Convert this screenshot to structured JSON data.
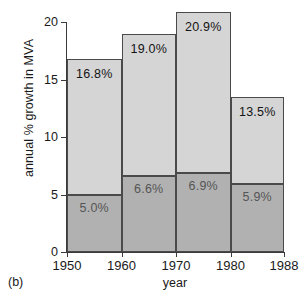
{
  "caption": "(b)",
  "chart_data": {
    "type": "bar",
    "subtype": "stacked",
    "title": "",
    "xlabel": "year",
    "ylabel": "annual % growth in MVA",
    "categories": [
      "1950",
      "1960",
      "1970",
      "1980"
    ],
    "x_tick_labels": [
      "1950",
      "1960",
      "1970",
      "1980",
      "1988"
    ],
    "y_tick_labels": [
      "0",
      "5",
      "10",
      "15",
      "20"
    ],
    "y_ticks": [
      0,
      5,
      10,
      15,
      20
    ],
    "ylim": [
      0,
      21.5
    ],
    "grid": false,
    "legend": "none",
    "series": [
      {
        "name": "lower segment",
        "color": "#b1b1b1",
        "values": [
          5.0,
          6.6,
          6.9,
          5.9
        ],
        "labels": [
          "5.0%",
          "6.6%",
          "6.9%",
          "5.9%"
        ]
      },
      {
        "name": "total",
        "color": "#d5d5d5",
        "values": [
          16.8,
          19.0,
          20.9,
          13.5
        ],
        "labels": [
          "16.8%",
          "19.0%",
          "20.9%",
          "13.5%"
        ]
      }
    ],
    "bars": [
      {
        "category": "1950",
        "total": 16.8,
        "total_label": "16.8%",
        "lower": 5.0,
        "lower_label": "5.0%"
      },
      {
        "category": "1960",
        "total": 19.0,
        "total_label": "19.0%",
        "lower": 6.6,
        "lower_label": "6.6%"
      },
      {
        "category": "1970",
        "total": 20.9,
        "total_label": "20.9%",
        "lower": 6.9,
        "lower_label": "6.9%"
      },
      {
        "category": "1980",
        "total": 13.5,
        "total_label": "13.5%",
        "lower": 5.9,
        "lower_label": "5.9%"
      }
    ]
  }
}
